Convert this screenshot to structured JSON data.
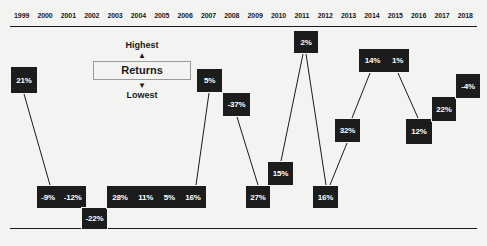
{
  "chart_data": {
    "type": "line",
    "title": "",
    "xlabel": "",
    "ylabel": "Returns",
    "grid": false,
    "legend_position": "top-center",
    "categories": [
      "1999",
      "2000",
      "2001",
      "2002",
      "2003",
      "2004",
      "2005",
      "2006",
      "2007",
      "2008",
      "2009",
      "2010",
      "2011",
      "2012",
      "2013",
      "2014",
      "2015",
      "2016",
      "2017",
      "2018"
    ],
    "values": [
      21,
      -9,
      -12,
      -22,
      28,
      11,
      5,
      16,
      5,
      -37,
      27,
      15,
      2,
      16,
      32,
      14,
      1,
      12,
      22,
      -4
    ],
    "value_labels": [
      "21%",
      "-9%",
      "-12%",
      "-22%",
      "28%",
      "11%",
      "5%",
      "16%",
      "5%",
      "-37%",
      "27%",
      "15%",
      "2%",
      "16%",
      "32%",
      "14%",
      "1%",
      "12%",
      "22%",
      "-4%"
    ],
    "series": [
      {
        "name": "Returns",
        "values": [
          21,
          -9,
          -12,
          -22,
          28,
          11,
          5,
          16,
          5,
          -37,
          27,
          15,
          2,
          16,
          32,
          14,
          1,
          12,
          22,
          -4
        ]
      }
    ],
    "annotations": {
      "axis_top": "Highest",
      "axis_bottom": "Lowest",
      "axis_label": "Returns"
    }
  },
  "axis": {
    "years": [
      "1999",
      "2000",
      "2001",
      "2002",
      "2003",
      "2004",
      "2005",
      "2006",
      "2007",
      "2008",
      "2009",
      "2010",
      "2011",
      "2012",
      "2013",
      "2014",
      "2015",
      "2016",
      "2017",
      "2018"
    ]
  },
  "legend": {
    "highest": "Highest",
    "up_arrow": "▲",
    "title": "Returns",
    "down_arrow": "▼",
    "lowest": "Lowest"
  },
  "nodes": [
    {
      "id": "n-1999",
      "labels": [
        "21%"
      ],
      "years": [
        "1999"
      ],
      "x": 10,
      "y": 66,
      "w": 28,
      "h": 28
    },
    {
      "id": "n-2000-2001",
      "labels": [
        "-9%",
        "-12%"
      ],
      "years": [
        "2000",
        "2001"
      ],
      "x": 36,
      "y": 185,
      "w": 51,
      "h": 24
    },
    {
      "id": "n-2002",
      "labels": [
        "-22%"
      ],
      "years": [
        "2002"
      ],
      "x": 81,
      "y": 207,
      "w": 27,
      "h": 23
    },
    {
      "id": "n-2003-2006",
      "labels": [
        "28%",
        "11%",
        "5%",
        "16%"
      ],
      "years": [
        "2003",
        "2004",
        "2005",
        "2006"
      ],
      "x": 106,
      "y": 185,
      "w": 101,
      "h": 24
    },
    {
      "id": "n-2007",
      "labels": [
        "5%"
      ],
      "years": [
        "2007"
      ],
      "x": 196,
      "y": 68,
      "w": 27,
      "h": 25
    },
    {
      "id": "n-2008",
      "labels": [
        "-37%"
      ],
      "years": [
        "2008"
      ],
      "x": 222,
      "y": 92,
      "w": 29,
      "h": 25
    },
    {
      "id": "n-2009",
      "labels": [
        "27%"
      ],
      "years": [
        "2009"
      ],
      "x": 245,
      "y": 185,
      "w": 26,
      "h": 24
    },
    {
      "id": "n-2010",
      "labels": [
        "15%"
      ],
      "years": [
        "2010"
      ],
      "x": 267,
      "y": 161,
      "w": 27,
      "h": 25
    },
    {
      "id": "n-2011",
      "labels": [
        "2%"
      ],
      "years": [
        "2011"
      ],
      "x": 293,
      "y": 30,
      "w": 26,
      "h": 24
    },
    {
      "id": "n-2012",
      "labels": [
        "16%"
      ],
      "years": [
        "2012"
      ],
      "x": 312,
      "y": 185,
      "w": 27,
      "h": 24
    },
    {
      "id": "n-2013",
      "labels": [
        "32%"
      ],
      "years": [
        "2013"
      ],
      "x": 334,
      "y": 118,
      "w": 27,
      "h": 25
    },
    {
      "id": "n-2014-2015",
      "labels": [
        "14%",
        "1%"
      ],
      "years": [
        "2014",
        "2015"
      ],
      "x": 358,
      "y": 48,
      "w": 52,
      "h": 25
    },
    {
      "id": "n-2016",
      "labels": [
        "12%"
      ],
      "years": [
        "2016"
      ],
      "x": 405,
      "y": 118,
      "w": 28,
      "h": 27
    },
    {
      "id": "n-2017",
      "labels": [
        "22%"
      ],
      "years": [
        "2017"
      ],
      "x": 431,
      "y": 96,
      "w": 26,
      "h": 26
    },
    {
      "id": "n-2018",
      "labels": [
        "-4%"
      ],
      "years": [
        "2018"
      ],
      "x": 455,
      "y": 73,
      "w": 26,
      "h": 26
    }
  ],
  "connectors": [
    {
      "from": "n-1999",
      "to": "n-2000-2001",
      "x1": 24,
      "y1": 94,
      "x2": 50,
      "y2": 185
    },
    {
      "from": "n-2003-2006",
      "to": "n-2007",
      "x1": 196,
      "y1": 185,
      "x2": 209,
      "y2": 93
    },
    {
      "from": "n-2008",
      "to": "n-2009",
      "x1": 237,
      "y1": 117,
      "x2": 258,
      "y2": 185
    },
    {
      "from": "n-2010",
      "to": "n-2011",
      "x1": 281,
      "y1": 161,
      "x2": 303,
      "y2": 54
    },
    {
      "from": "n-2011",
      "to": "n-2012",
      "x1": 306,
      "y1": 54,
      "x2": 326,
      "y2": 185
    },
    {
      "from": "n-2012",
      "to": "n-2013",
      "x1": 330,
      "y1": 185,
      "x2": 347,
      "y2": 143
    },
    {
      "from": "n-2013",
      "to": "n-2014-2015",
      "x1": 352,
      "y1": 118,
      "x2": 370,
      "y2": 73
    },
    {
      "from": "n-2014-2015",
      "to": "n-2016",
      "x1": 398,
      "y1": 73,
      "x2": 418,
      "y2": 118
    }
  ]
}
